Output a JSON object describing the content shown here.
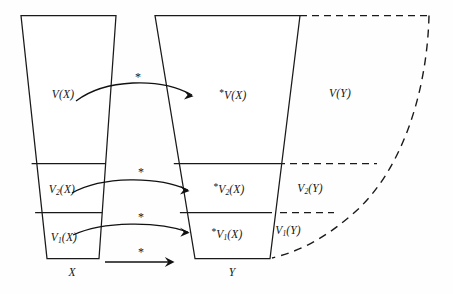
{
  "figure": {
    "type": "mathematical-diagram",
    "background_color": "#ffffff",
    "line_color": "#1a1a1a"
  },
  "labels": {
    "left_full": "V(X)",
    "left_v2": "V₂(X)",
    "left_v1": "V₁(X)",
    "left_base": "X",
    "right_full_star": "*V(X)",
    "right_v2_star": "*V₂(X)",
    "right_v1_star": "*V₁(X)",
    "right_base": "Y",
    "outer_full": "V(Y)",
    "outer_v2": "V₂(Y)",
    "outer_v1": "V₁(Y)"
  },
  "label_parts": {
    "left_v2_base": "V",
    "left_v2_sub": "2",
    "left_v2_tail": "(X)",
    "left_v1_base": "V",
    "left_v1_sub": "1",
    "left_v1_tail": "(X)",
    "star": "*",
    "right_full_base": "V",
    "right_full_tail": "(X)",
    "right_v2_base": "V",
    "right_v2_sub": "2",
    "right_v2_tail": "(X)",
    "right_v1_base": "V",
    "right_v1_sub": "1",
    "right_v1_tail": "(X)",
    "outer_v2_base": "V",
    "outer_v2_sub": "2",
    "outer_v2_tail": "(Y)",
    "outer_v1_base": "V",
    "outer_v1_sub": "1",
    "outer_v1_tail": "(Y)"
  },
  "asterisks": {
    "top": "*",
    "middle": "*",
    "lower": "*",
    "bottom": "*"
  },
  "arrows": [
    {
      "name": "arrow-v-full",
      "label": "*",
      "from": "V(X)",
      "to": "*V(X)",
      "style": "curved"
    },
    {
      "name": "arrow-v2",
      "label": "*",
      "from": "V₂(X)",
      "to": "*V₂(X)",
      "style": "curved"
    },
    {
      "name": "arrow-v1",
      "label": "*",
      "from": "V₁(X)",
      "to": "*V₁(X)",
      "style": "curved"
    },
    {
      "name": "arrow-base",
      "label": "*",
      "from": "X",
      "to": "Y",
      "style": "straight"
    }
  ]
}
